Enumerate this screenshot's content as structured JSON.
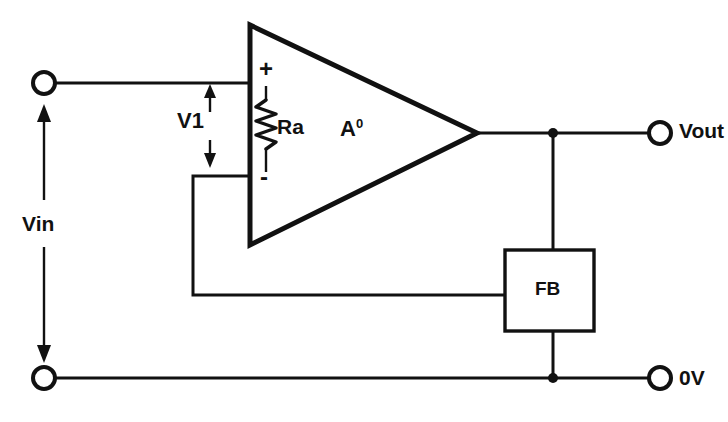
{
  "diagram": {
    "background_color": "#ffffff",
    "line_color": "#111111",
    "labels": {
      "input_source": "Vin",
      "differential_input": "V1",
      "input_resistor": "Ra",
      "gain_symbol": "A",
      "gain_exponent": "0",
      "feedback_block": "FB",
      "output_terminal": "Vout",
      "ground_terminal": "0V",
      "noninverting_input": "+",
      "inverting_input": "-"
    },
    "components": [
      {
        "name": "op-amp-triangle",
        "type": "amplifier",
        "label": "A0"
      },
      {
        "name": "feedback-block",
        "type": "block",
        "label": "FB"
      },
      {
        "name": "input-resistor",
        "type": "resistor",
        "label": "Ra"
      },
      {
        "name": "input-terminal-top",
        "type": "terminal",
        "label": "Vin"
      },
      {
        "name": "input-terminal-bottom",
        "type": "terminal",
        "label": "Vin"
      },
      {
        "name": "output-terminal",
        "type": "terminal",
        "label": "Vout"
      },
      {
        "name": "ground-terminal",
        "type": "terminal",
        "label": "0V"
      }
    ],
    "annotations": [
      {
        "name": "vin-arrow",
        "text": "Vin",
        "style": "double-headed-vertical-arrow"
      },
      {
        "name": "v1-arrow",
        "text": "V1",
        "style": "double-headed-vertical-arrow"
      }
    ]
  }
}
